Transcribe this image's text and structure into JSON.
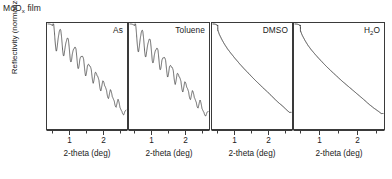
{
  "figure": {
    "title_main": "MoO",
    "title_sub": "x",
    "title_tail": " film",
    "ylabel": "Reflectivity (normalized)",
    "xlabel": "2-theta (deg)",
    "line_color": "#262626",
    "frame_color": "#3a3a3a"
  },
  "chart_data": {
    "type": "line",
    "title": "MoOx film",
    "xlabel": "2-theta (deg)",
    "ylabel": "Reflectivity (normalized)",
    "xlim": [
      0.3,
      2.75
    ],
    "ylim": [
      0.0,
      1.0
    ],
    "xticks": [
      1,
      2
    ],
    "xticklabels": [
      "1",
      "2"
    ],
    "xminorticks": [
      0.5,
      1.5,
      2.5
    ],
    "yticks": [],
    "grid": false,
    "legend": "none",
    "log_y": true,
    "panels": [
      {
        "label": "As",
        "fringes": true,
        "fringe_count": 10,
        "description": "Sharp critical-angle edge then exponential decay modulated by strong Kiessig fringes of decreasing amplitude",
        "x": [
          0.33,
          0.38,
          0.42,
          0.46,
          0.52,
          0.58,
          0.64,
          0.7,
          0.76,
          0.82,
          0.88,
          0.94,
          1.0,
          1.06,
          1.12,
          1.18,
          1.24,
          1.3,
          1.36,
          1.42,
          1.48,
          1.54,
          1.6,
          1.66,
          1.72,
          1.78,
          1.84,
          1.9,
          1.96,
          2.02,
          2.08,
          2.14,
          2.2,
          2.26,
          2.32,
          2.38,
          2.44,
          2.5,
          2.56,
          2.62,
          2.68
        ],
        "y": [
          1.0,
          0.99,
          0.97,
          0.78,
          0.6,
          0.63,
          0.51,
          0.54,
          0.43,
          0.46,
          0.36,
          0.39,
          0.3,
          0.33,
          0.25,
          0.28,
          0.21,
          0.235,
          0.175,
          0.195,
          0.145,
          0.162,
          0.12,
          0.134,
          0.099,
          0.11,
          0.081,
          0.09,
          0.066,
          0.073,
          0.054,
          0.06,
          0.044,
          0.048,
          0.035,
          0.039,
          0.028,
          0.031,
          0.023,
          0.025,
          0.019
        ]
      },
      {
        "label": "Toluene",
        "fringes": true,
        "fringe_count": 10,
        "description": "Nearly identical to as-deposited: strong Kiessig fringes indicating film remains intact",
        "x": [
          0.33,
          0.38,
          0.42,
          0.46,
          0.52,
          0.58,
          0.64,
          0.7,
          0.76,
          0.82,
          0.88,
          0.94,
          1.0,
          1.06,
          1.12,
          1.18,
          1.24,
          1.3,
          1.36,
          1.42,
          1.48,
          1.54,
          1.6,
          1.66,
          1.72,
          1.78,
          1.84,
          1.9,
          1.96,
          2.02,
          2.08,
          2.14,
          2.2,
          2.26,
          2.32,
          2.38,
          2.44,
          2.5,
          2.56,
          2.62,
          2.68
        ],
        "y": [
          1.0,
          0.99,
          0.96,
          0.76,
          0.58,
          0.61,
          0.49,
          0.52,
          0.41,
          0.44,
          0.345,
          0.375,
          0.288,
          0.315,
          0.24,
          0.265,
          0.2,
          0.222,
          0.166,
          0.185,
          0.138,
          0.154,
          0.114,
          0.128,
          0.094,
          0.105,
          0.077,
          0.086,
          0.063,
          0.07,
          0.051,
          0.057,
          0.042,
          0.046,
          0.034,
          0.037,
          0.027,
          0.03,
          0.022,
          0.024,
          0.018
        ]
      },
      {
        "label": "DMSO",
        "fringes": false,
        "fringe_count": 0,
        "description": "Featureless monotonic decay, no fringes: film dissolved or severely roughened",
        "x": [
          0.33,
          0.38,
          0.44,
          0.5,
          0.58,
          0.66,
          0.76,
          0.88,
          1.0,
          1.15,
          1.3,
          1.45,
          1.6,
          1.75,
          1.9,
          2.05,
          2.2,
          2.35,
          2.5,
          2.62,
          2.7
        ],
        "y": [
          1.0,
          0.98,
          0.8,
          0.63,
          0.5,
          0.41,
          0.33,
          0.265,
          0.215,
          0.168,
          0.133,
          0.107,
          0.086,
          0.07,
          0.057,
          0.047,
          0.038,
          0.031,
          0.026,
          0.022,
          0.02
        ]
      },
      {
        "label": "H2O",
        "label_main": "H",
        "label_sub": "2",
        "label_tail": "O",
        "fringes": false,
        "fringe_count": 0,
        "description": "Featureless monotonic decay, no fringes: film dissolved or severely roughened",
        "x": [
          0.33,
          0.38,
          0.44,
          0.5,
          0.58,
          0.66,
          0.76,
          0.88,
          1.0,
          1.15,
          1.3,
          1.45,
          1.6,
          1.75,
          1.9,
          2.05,
          2.2,
          2.35,
          2.5,
          2.62,
          2.7
        ],
        "y": [
          1.0,
          0.98,
          0.78,
          0.61,
          0.48,
          0.39,
          0.315,
          0.252,
          0.204,
          0.159,
          0.126,
          0.101,
          0.081,
          0.066,
          0.054,
          0.044,
          0.036,
          0.029,
          0.024,
          0.021,
          0.019
        ]
      }
    ]
  },
  "panels": [
    {
      "label": "As",
      "xlabel": "2-theta (deg)",
      "t1": "1",
      "t2": "2"
    },
    {
      "label": "Toluene",
      "xlabel": "2-theta (deg)",
      "t1": "1",
      "t2": "2"
    },
    {
      "label": "DMSO",
      "xlabel": "2-theta (deg)",
      "t1": "1",
      "t2": "2"
    },
    {
      "label": "H2O",
      "xlabel": "2-theta (deg)",
      "t1": "1",
      "t2": "2"
    }
  ]
}
